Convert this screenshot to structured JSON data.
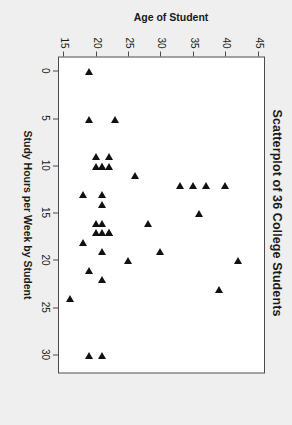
{
  "chart_data": {
    "type": "scatter",
    "title": "Scatterplot of 36 College Students",
    "xlabel": "Study Hours per Week by Student",
    "ylabel": "Age of Student",
    "xlim": [
      -1.5,
      32
    ],
    "ylim": [
      14,
      46
    ],
    "xticks": [
      0,
      5,
      10,
      15,
      20,
      25,
      30
    ],
    "yticks": [
      15,
      20,
      25,
      30,
      35,
      40,
      45
    ],
    "grid": false,
    "legend": null,
    "marker": "triangle",
    "marker_color": "#111111",
    "background": "#efefef",
    "panel_background": "#ffffff",
    "n_points": 36,
    "x": [
      0,
      5,
      5,
      9,
      9,
      10,
      10,
      10,
      10,
      11,
      12,
      12,
      12,
      13,
      13,
      14,
      15,
      16,
      16,
      17,
      17,
      17,
      18,
      19,
      19,
      20,
      20,
      21,
      23,
      24,
      30,
      30,
      16,
      22,
      12,
      17
    ],
    "y": [
      19,
      23,
      19,
      22,
      20,
      22,
      21,
      21,
      20,
      26,
      40,
      37,
      33,
      21,
      18,
      21,
      36,
      28,
      21,
      22,
      21,
      20,
      18,
      30,
      21,
      42,
      25,
      19,
      39,
      16,
      21,
      19,
      20,
      21,
      35,
      22
    ],
    "points": [
      {
        "x": 0,
        "y": 19
      },
      {
        "x": 5,
        "y": 23
      },
      {
        "x": 5,
        "y": 19
      },
      {
        "x": 9,
        "y": 22
      },
      {
        "x": 9,
        "y": 20
      },
      {
        "x": 10,
        "y": 22
      },
      {
        "x": 10,
        "y": 21
      },
      {
        "x": 10,
        "y": 21
      },
      {
        "x": 10,
        "y": 20
      },
      {
        "x": 11,
        "y": 26
      },
      {
        "x": 12,
        "y": 40
      },
      {
        "x": 12,
        "y": 37
      },
      {
        "x": 12,
        "y": 33
      },
      {
        "x": 13,
        "y": 21
      },
      {
        "x": 13,
        "y": 18
      },
      {
        "x": 14,
        "y": 21
      },
      {
        "x": 15,
        "y": 36
      },
      {
        "x": 16,
        "y": 28
      },
      {
        "x": 16,
        "y": 21
      },
      {
        "x": 17,
        "y": 22
      },
      {
        "x": 17,
        "y": 21
      },
      {
        "x": 17,
        "y": 20
      },
      {
        "x": 18,
        "y": 18
      },
      {
        "x": 19,
        "y": 30
      },
      {
        "x": 19,
        "y": 21
      },
      {
        "x": 20,
        "y": 42
      },
      {
        "x": 20,
        "y": 25
      },
      {
        "x": 21,
        "y": 19
      },
      {
        "x": 23,
        "y": 39
      },
      {
        "x": 24,
        "y": 16
      },
      {
        "x": 30,
        "y": 21
      },
      {
        "x": 30,
        "y": 19
      },
      {
        "x": 16,
        "y": 20
      },
      {
        "x": 22,
        "y": 21
      },
      {
        "x": 12,
        "y": 35
      },
      {
        "x": 17,
        "y": 22
      }
    ]
  }
}
